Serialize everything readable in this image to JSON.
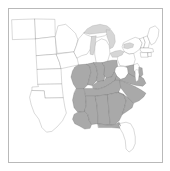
{
  "figure": {
    "type": "choropleth-map",
    "region": "Eastern United States",
    "caption": ""
  },
  "colors": {
    "highlight_fill": "#a9a9a9",
    "base_fill": "#ffffff",
    "lake_fill": "#d6d6d6",
    "state_border": "#4a4a4a",
    "frame_border": "#b9b9b9",
    "background": "#ffffff"
  },
  "map_data": {
    "type": "choropleth",
    "projection": "equirectangular",
    "highlight_label": "highlighted",
    "base_label": "not highlighted",
    "highlighted_states": [
      "Missouri",
      "Illinois",
      "Indiana",
      "Ohio",
      "Kentucky",
      "Tennessee",
      "Arkansas",
      "Louisiana",
      "Mississippi",
      "Alabama",
      "Georgia",
      "South Carolina",
      "North Carolina",
      "Virginia",
      "Maryland",
      "Delaware",
      "Florida Panhandle"
    ],
    "unhighlighted_states": [
      "Montana",
      "North Dakota",
      "South Dakota",
      "Nebraska",
      "Kansas",
      "Oklahoma",
      "Texas",
      "Minnesota",
      "Iowa",
      "Wisconsin",
      "Michigan",
      "West Virginia",
      "Pennsylvania",
      "New York",
      "New Jersey",
      "Connecticut",
      "Rhode Island",
      "Massachusetts",
      "Vermont",
      "New Hampshire",
      "Maine",
      "Florida Peninsula"
    ],
    "water_bodies": [
      "Lake Superior",
      "Lake Michigan",
      "Lake Huron",
      "Lake Erie",
      "Lake Ontario",
      "Chesapeake Bay"
    ],
    "highlighted_count": 17,
    "legend": {
      "visible": false,
      "entries": []
    }
  }
}
